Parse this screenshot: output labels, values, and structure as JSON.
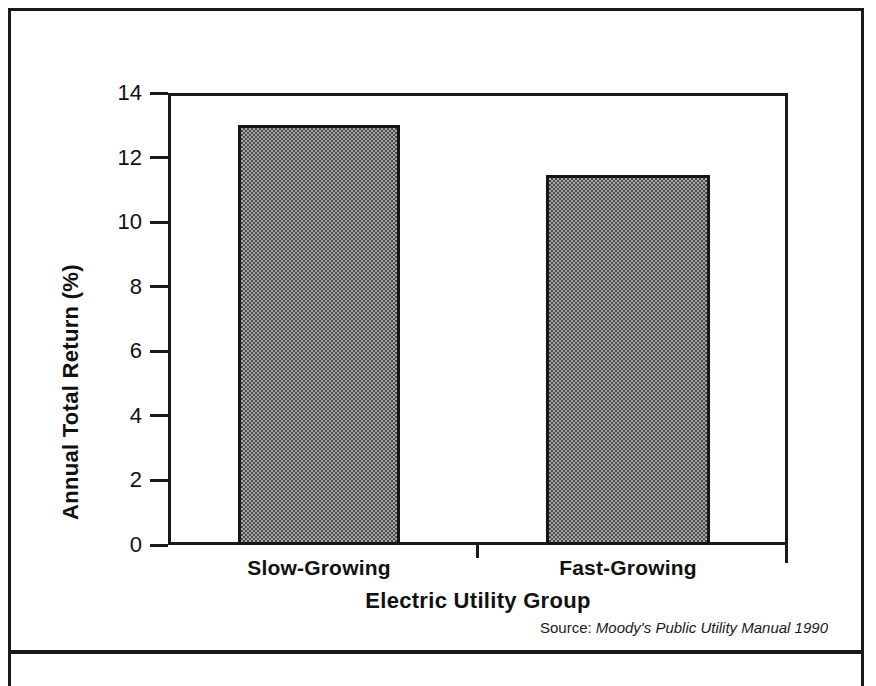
{
  "figure": {
    "source_prefix": "Source:",
    "source_reference": "Moody's Public Utility Manual 1990"
  },
  "chart_data": {
    "type": "bar",
    "title": "",
    "categories": [
      "Slow-Growing",
      "Fast-Growing"
    ],
    "values": [
      13.0,
      11.45
    ],
    "xlabel": "Electric Utility Group",
    "ylabel": "Annual Total Return (%)",
    "ylim": [
      0,
      14
    ],
    "ytick_labels": [
      "0",
      "2",
      "4",
      "6",
      "8",
      "10",
      "12",
      "14"
    ],
    "ytick_values": [
      0,
      2,
      4,
      6,
      8,
      10,
      12,
      14
    ],
    "grid": false,
    "legend": false,
    "bar_fill": "#808080",
    "bar_edge": "#151515",
    "axis_color": "#1a1a1a"
  }
}
